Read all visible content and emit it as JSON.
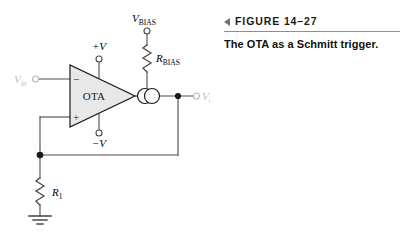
{
  "figure": {
    "marker_icon": "left-triangle-icon",
    "number_label": "FIGURE 14–27",
    "caption": "The OTA as a Schmitt trigger."
  },
  "circuit": {
    "title": "OTA Schmitt trigger schematic",
    "amplifier": {
      "body_label": "OTA",
      "inverting_input_sign": "−",
      "noninverting_input_sign": "+",
      "fill_color": "#e8e8e8",
      "stroke_color": "#1a1a1a"
    },
    "supply_positive": {
      "symbol": "+V",
      "var": "V",
      "prefix": "+",
      "terminal": "open-circle"
    },
    "supply_negative": {
      "symbol": "−V",
      "var": "V",
      "prefix": "−",
      "terminal": "open-circle"
    },
    "bias_source": {
      "var": "V",
      "subscript": "BIAS",
      "terminal": "open-circle"
    },
    "bias_resistor": {
      "var": "R",
      "subscript": "BIAS",
      "type": "zigzag-resistor"
    },
    "feedback_resistor": {
      "var": "R",
      "subscript": "1",
      "type": "zigzag-resistor"
    },
    "input_terminal": {
      "var": "V",
      "subscript": "in",
      "terminal": "open-circle",
      "color": "#b9bdc4"
    },
    "output_terminal": {
      "var": "V",
      "subscript": "out",
      "terminal": "open-circle",
      "color": "#b9bdc4"
    },
    "current_source": {
      "name": "double-circle-current-source",
      "circle_count": 2
    },
    "ground": {
      "name": "earth-ground-symbol",
      "bar_count": 3
    },
    "junction_dots": 2,
    "wire_color": "#4a4a4a"
  }
}
